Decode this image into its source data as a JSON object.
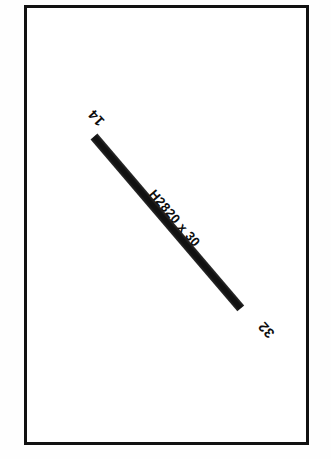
{
  "drawing": {
    "title": "Structural Member Detail",
    "background_color": "#ffffff",
    "ink_color": "#111111",
    "frame": {
      "name": "drawing-border",
      "border_color": "#111111",
      "border_width_px": 3
    },
    "member": {
      "designation": "H2820 x 30",
      "section_label": "H2820",
      "multiplier_symbol": "x",
      "thickness_label": "30",
      "fill_color": "#111111",
      "orientation_deg": 49.5
    },
    "nodes": [
      {
        "id": "start",
        "number": "14",
        "position": "upper-left",
        "rotation_deg": 228
      },
      {
        "id": "end",
        "number": "32",
        "position": "lower-right",
        "rotation_deg": 228
      }
    ]
  }
}
